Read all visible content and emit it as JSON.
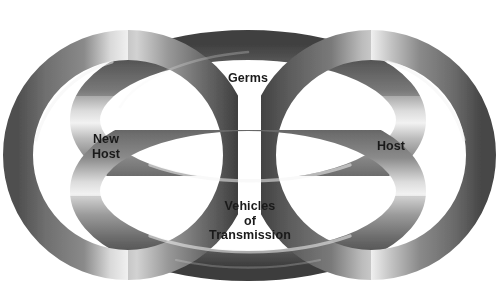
{
  "diagram": {
    "type": "interlocking-rings",
    "background_color": "#ffffff",
    "ring_color": "#7b7b7b",
    "ring_shadow_color": "#4a4a4a",
    "ring_highlight_color": "#e8e8e8",
    "label_color": "#1a1a1a",
    "rings": [
      {
        "id": "new-host",
        "label": "New\nHost",
        "label_lines": [
          "New",
          "Host"
        ],
        "position": "left",
        "shape": "circle"
      },
      {
        "id": "germs",
        "label": "Germs",
        "label_lines": [
          "Germs"
        ],
        "position": "top",
        "shape": "ellipse"
      },
      {
        "id": "host",
        "label": "Host",
        "label_lines": [
          "Host"
        ],
        "position": "right",
        "shape": "circle"
      },
      {
        "id": "vehicles-of-transmission",
        "label": "Vehicles\nof\nTransmission",
        "label_lines": [
          "Vehicles",
          "of",
          "Transmission"
        ],
        "position": "bottom",
        "shape": "ellipse"
      }
    ]
  }
}
